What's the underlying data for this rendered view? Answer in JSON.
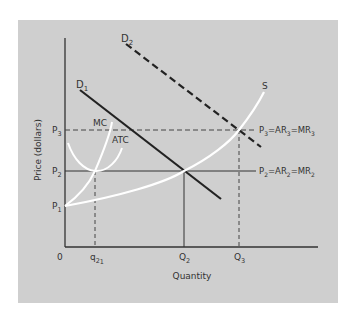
{
  "diagram": {
    "background_color": "#cfcfcf",
    "axis_color": "#333333",
    "curve_dark_color": "#222222",
    "curve_light_color": "#ffffff",
    "axes": {
      "y_label": "Price (dollars)",
      "x_label": "Quantity",
      "origin_label": "0"
    },
    "price_levels": [
      {
        "id": "P3",
        "label": "P",
        "sub": "3"
      },
      {
        "id": "P2",
        "label": "P",
        "sub": "2"
      },
      {
        "id": "P1",
        "label": "P",
        "sub": "1"
      }
    ],
    "quantity_levels": [
      {
        "id": "q21",
        "label": "q",
        "sub": "2",
        "subsub": "1"
      },
      {
        "id": "Q2",
        "label": "Q",
        "sub": "2"
      },
      {
        "id": "Q3",
        "label": "Q",
        "sub": "3"
      }
    ],
    "curves": {
      "D1": {
        "label": "D",
        "sub": "1"
      },
      "D2": {
        "label": "D",
        "sub": "2"
      },
      "S": {
        "label": "S"
      },
      "MC": {
        "label": "MC"
      },
      "ATC": {
        "label": "ATC"
      }
    },
    "equilibrium_labels": {
      "p3": {
        "p": "P",
        "ps": "3",
        "ar": "=AR",
        "ars": "3",
        "mr": "=MR",
        "mrs": "3"
      },
      "p2": {
        "p": "P",
        "ps": "2",
        "ar": "=AR",
        "ars": "2",
        "mr": "=MR",
        "mrs": "2"
      }
    }
  }
}
